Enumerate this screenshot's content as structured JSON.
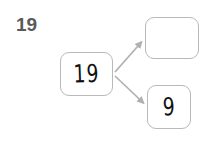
{
  "worksheet": {
    "problem_number": "19",
    "background_color": "#ffffff"
  },
  "diagram": {
    "type": "number-bond-decomposition",
    "stroke_color": "#b9b9b9",
    "arrow_color": "#b0b0b0",
    "handwriting_color": "#111111",
    "source_box": {
      "label": "19",
      "filled": true
    },
    "target_box_top": {
      "label": "",
      "filled": false
    },
    "target_box_bottom": {
      "label": "9",
      "filled": true
    },
    "arrows": [
      {
        "name": "arrow-to-top-box",
        "direction": "up-right"
      },
      {
        "name": "arrow-to-bottom-box",
        "direction": "down-right"
      }
    ]
  }
}
